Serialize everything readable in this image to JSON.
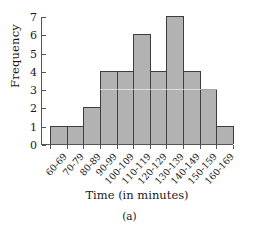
{
  "chart_data": {
    "type": "bar",
    "title": "",
    "subtitle": "",
    "xlabel": "Time (in minutes)",
    "ylabel": "Frequency",
    "categories": [
      "60-69",
      "70-79",
      "80-89",
      "90-99",
      "100-109",
      "110-119",
      "120-129",
      "130-139",
      "140-149",
      "150-159",
      "160-169"
    ],
    "values": [
      1,
      1,
      2,
      4,
      4,
      6,
      4,
      7,
      4,
      3,
      1
    ],
    "ylim": [
      0,
      7
    ],
    "ytick_labels": [
      "0",
      "1",
      "2",
      "3",
      "4",
      "5",
      "6",
      "7"
    ],
    "ytick_values": [
      0,
      1,
      2,
      3,
      4,
      5,
      6,
      7
    ],
    "grid": false,
    "legend": null,
    "legend_position": "none",
    "annotations": [],
    "bar_fill_color": "#b2b2b2",
    "bar_edge_color": "#3d3d3d",
    "axis_color": "#555555",
    "bars_contiguous": true
  },
  "caption": {
    "text": "(a)"
  }
}
